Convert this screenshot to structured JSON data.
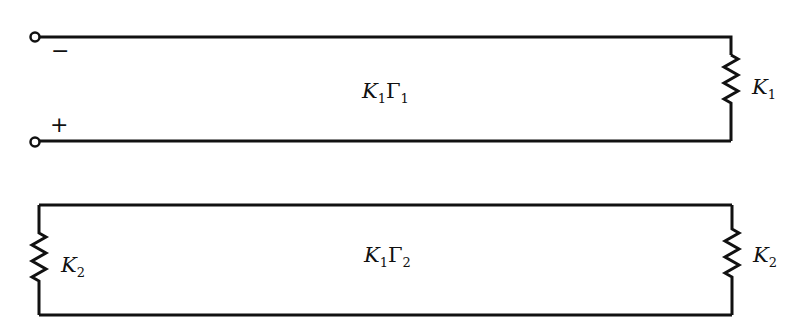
{
  "diagram": {
    "line1": {
      "label_main": "K",
      "label_sub1": "1",
      "label_gamma": "Γ",
      "label_sub2": "1",
      "terminal_minus": "−",
      "terminal_plus": "+",
      "load_resistor": {
        "name": "K",
        "sub": "1"
      }
    },
    "line2": {
      "label_main": "K",
      "label_sub1": "1",
      "label_gamma": "Γ",
      "label_sub2": "2",
      "left_resistor": {
        "name": "K",
        "sub": "2"
      },
      "right_resistor": {
        "name": "K",
        "sub": "2"
      }
    },
    "colors": {
      "stroke": "#111111",
      "background": "#ffffff"
    }
  }
}
